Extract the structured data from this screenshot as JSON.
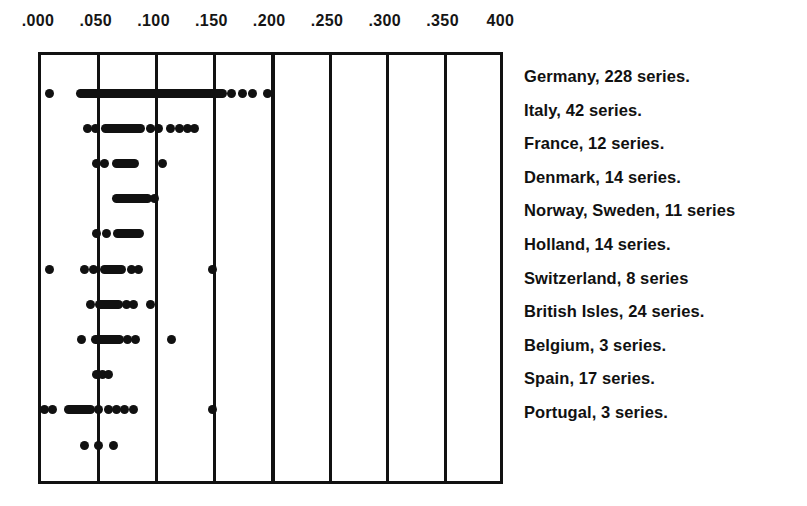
{
  "figure": {
    "title": "",
    "background": "#ffffff",
    "ink_color": "#111111"
  },
  "axis": {
    "labels": [
      ".000",
      ".050",
      ".100",
      ".150",
      ".200",
      ".250",
      ".300",
      ".350",
      "400"
    ],
    "values": [
      0.0,
      0.05,
      0.1,
      0.15,
      0.2,
      0.25,
      0.3,
      0.35,
      0.4
    ]
  },
  "legend": {
    "items": [
      {
        "label": "Germany, 228 series."
      },
      {
        "label": "Italy, 42 series."
      },
      {
        "label": "France, 12 series."
      },
      {
        "label": "Denmark, 14 series."
      },
      {
        "label": "Norway, Sweden, 11 series"
      },
      {
        "label": "Holland, 14 series."
      },
      {
        "label": "Switzerland, 8 series"
      },
      {
        "label": "British Isles, 24 series."
      },
      {
        "label": "Belgium, 3 series."
      },
      {
        "label": "Spain, 17 series."
      },
      {
        "label": "Portugal, 3 series."
      }
    ]
  },
  "chart_data": {
    "type": "scatter",
    "title": "",
    "xlabel": "",
    "ylabel": "",
    "xlim": [
      0.0,
      0.41
    ],
    "grid": true,
    "legend_position": "right",
    "xticks": [
      0.0,
      0.05,
      0.1,
      0.15,
      0.2,
      0.25,
      0.3,
      0.35,
      0.4
    ],
    "xticklabels": [
      ".000",
      ".050",
      ".100",
      ".150",
      ".200",
      ".250",
      ".300",
      ".350",
      "400"
    ],
    "series": [
      {
        "name": "Germany",
        "count": 228,
        "points": [
          0.007,
          0.165,
          0.174,
          0.183,
          0.196
        ],
        "bands": [
          {
            "start": 0.034,
            "end": 0.148
          },
          {
            "start": 0.15,
            "end": 0.157
          }
        ]
      },
      {
        "name": "Italy",
        "count": 42,
        "points": [
          0.04,
          0.047,
          0.095,
          0.102,
          0.112,
          0.12,
          0.127,
          0.133
        ],
        "bands": [
          {
            "start": 0.056,
            "end": 0.086
          }
        ]
      },
      {
        "name": "France",
        "count": 12,
        "points": [
          0.048,
          0.055,
          0.105
        ],
        "bands": [
          {
            "start": 0.065,
            "end": 0.081
          }
        ]
      },
      {
        "name": "Denmark",
        "count": 14,
        "points": [
          0.098
        ],
        "bands": [
          {
            "start": 0.065,
            "end": 0.092
          }
        ]
      },
      {
        "name": "Norway, Sweden",
        "count": 11,
        "points": [
          0.048,
          0.057
        ],
        "bands": [
          {
            "start": 0.066,
            "end": 0.085
          }
        ]
      },
      {
        "name": "Holland",
        "count": 14,
        "points": [
          0.007,
          0.038,
          0.045,
          0.078,
          0.084,
          0.148
        ],
        "bands": [
          {
            "start": 0.055,
            "end": 0.07
          }
        ]
      },
      {
        "name": "Switzerland",
        "count": 8,
        "points": [
          0.043,
          0.074,
          0.08,
          0.095
        ],
        "bands": [
          {
            "start": 0.051,
            "end": 0.067
          }
        ]
      },
      {
        "name": "British Isles",
        "count": 24,
        "points": [
          0.035,
          0.075,
          0.082,
          0.113
        ],
        "bands": [
          {
            "start": 0.047,
            "end": 0.068
          }
        ]
      },
      {
        "name": "Belgium",
        "count": 3,
        "points": [
          0.048,
          0.053,
          0.058
        ],
        "bands": []
      },
      {
        "name": "Spain",
        "count": 17,
        "points": [
          0.003,
          0.01,
          0.05,
          0.058,
          0.065,
          0.072,
          0.08,
          0.148
        ],
        "bands": [
          {
            "start": 0.024,
            "end": 0.043
          }
        ]
      },
      {
        "name": "Portugal",
        "count": 3,
        "points": [
          0.038,
          0.05,
          0.063
        ],
        "bands": []
      }
    ]
  }
}
